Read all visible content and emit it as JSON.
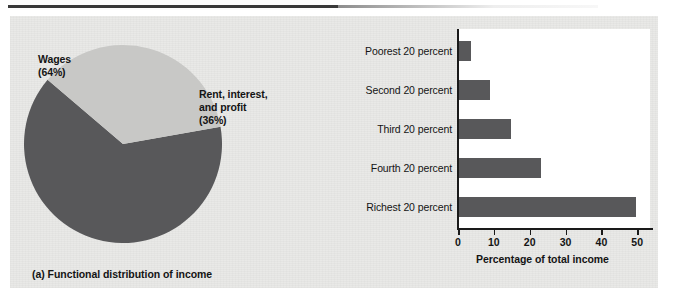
{
  "figure": {
    "panel_background": "#e9e9e7",
    "page_background": "#ffffff",
    "rule_color": "#3a3a3a"
  },
  "panel_a": {
    "caption": "(a) Functional distribution of income",
    "labels": {
      "wages_name": "Wages",
      "wages_pct": "(64%)",
      "rent_line1": "Rent, interest,",
      "rent_line2": "and profit",
      "rent_pct": "(36%)"
    }
  },
  "panel_b": {
    "caption": "(b) Personal distribution of income",
    "x_axis_title": "Percentage of total income"
  },
  "chart_data": [
    {
      "type": "pie",
      "title": "(a) Functional distribution of income",
      "slices": [
        {
          "label": "Wages",
          "value": 64,
          "display": "(64%)",
          "color": "#58585a"
        },
        {
          "label": "Rent, interest, and profit",
          "value": 36,
          "display": "(36%)",
          "color": "#c8c8c6"
        }
      ],
      "start_angle_deg": -10,
      "legend": "none",
      "labels_position": "outside"
    },
    {
      "type": "bar",
      "orientation": "horizontal",
      "title": "(b) Personal distribution of income",
      "categories": [
        "Poorest 20 percent",
        "Second 20 percent",
        "Third 20 percent",
        "Fourth 20 percent",
        "Richest 20 percent"
      ],
      "values": [
        3.6,
        8.8,
        14.8,
        23.0,
        49.7
      ],
      "xlabel": "Percentage of total income",
      "ylabel": "",
      "xlim": [
        0,
        53
      ],
      "xticks": [
        0,
        10,
        20,
        30,
        40,
        50
      ],
      "xtick_labels": [
        "0",
        "10",
        "20",
        "30",
        "40",
        "50"
      ],
      "grid": false,
      "legend": "none",
      "bar_color": "#58585a",
      "plot_background": "#ffffff"
    }
  ]
}
